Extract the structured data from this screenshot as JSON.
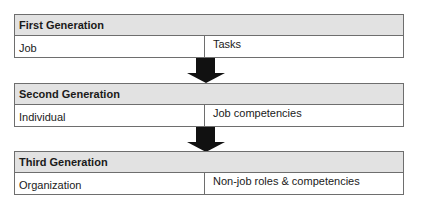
{
  "diagram": {
    "generations": [
      {
        "title": "First Generation",
        "left": "Job",
        "right": "Tasks"
      },
      {
        "title": "Second Generation",
        "left": "Individual",
        "right": "Job competencies"
      },
      {
        "title": "Third Generation",
        "left": "Organization",
        "right": "Non-job roles & competencies"
      }
    ],
    "arrows": [
      "down-arrow",
      "down-arrow"
    ],
    "colors": {
      "header_bg": "#e2e2e2",
      "border": "#6e6e6e",
      "arrow": "#111111"
    }
  }
}
